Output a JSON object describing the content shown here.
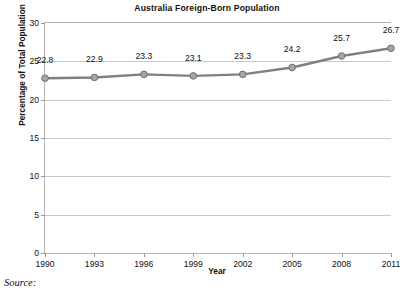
{
  "chart_data": {
    "type": "line",
    "title": "Australia Foreign-Born Population",
    "xlabel": "Year",
    "ylabel": "Percentage of Total Population",
    "categories": [
      "1990",
      "1993",
      "1996",
      "1999",
      "2002",
      "2005",
      "2008",
      "2011"
    ],
    "values": [
      22.8,
      22.9,
      23.3,
      23.1,
      23.3,
      24.2,
      25.7,
      26.7
    ],
    "point_labels": [
      "22.8",
      "22.9",
      "23.3",
      "23.1",
      "23.3",
      "24.2",
      "25.7",
      "26.7"
    ],
    "ylim": [
      0,
      30
    ],
    "ytick_values": [
      0,
      5,
      10,
      15,
      20,
      25,
      30
    ],
    "ytick_labels": [
      "0",
      "5",
      "10",
      "15",
      "20",
      "25",
      "30"
    ],
    "grid": "horizontal",
    "legend": "none",
    "series": [
      {
        "name": "Percentage of Total Population",
        "values": [
          22.8,
          22.9,
          23.3,
          23.1,
          23.3,
          24.2,
          25.7,
          26.7
        ]
      }
    ],
    "colors": {
      "line": "#808080",
      "marker_fill": "#a6a6a6",
      "marker_stroke": "#6e6e6e",
      "gridline": "#c9c9c9",
      "axis": "#b4b4b4",
      "text": "#111111",
      "background": "#ffffff"
    }
  },
  "caption": {
    "source_label": "Source:"
  }
}
